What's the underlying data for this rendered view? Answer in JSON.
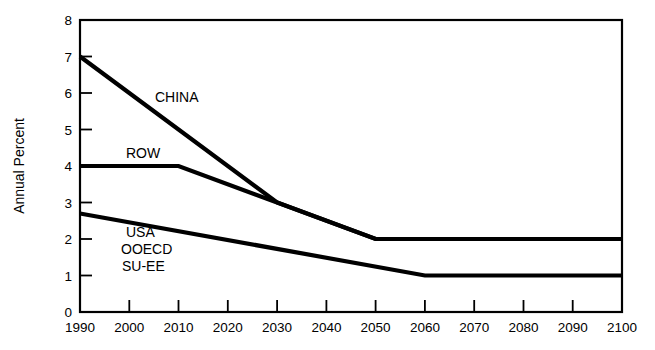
{
  "chart_data": {
    "type": "line",
    "title": "",
    "xlabel": "",
    "ylabel": "Annual Percent",
    "xlim": [
      1990,
      2100
    ],
    "ylim": [
      0,
      8
    ],
    "grid": false,
    "legend": "inline-annotations",
    "x_ticks": [
      "1990",
      "2000",
      "2010",
      "2020",
      "2030",
      "2040",
      "2050",
      "2060",
      "2070",
      "2080",
      "2090",
      "2100"
    ],
    "y_ticks": [
      "0",
      "1",
      "2",
      "3",
      "4",
      "5",
      "6",
      "7",
      "8"
    ],
    "series": [
      {
        "name": "CHINA",
        "label": "CHINA",
        "x": [
          1990,
          2030,
          2050,
          2100
        ],
        "values": [
          7.0,
          3.0,
          2.0,
          2.0
        ]
      },
      {
        "name": "ROW",
        "label": "ROW",
        "x": [
          1990,
          2010,
          2030,
          2050,
          2100
        ],
        "values": [
          4.0,
          4.0,
          3.0,
          2.0,
          2.0
        ]
      },
      {
        "name": "USA-OOECD-SU-EE",
        "label": "USA",
        "x": [
          1990,
          2060,
          2100
        ],
        "values": [
          2.7,
          1.0,
          1.0
        ]
      }
    ],
    "annotations": [
      {
        "text": "CHINA",
        "x": 2020,
        "y": 6.0
      },
      {
        "text": "ROW",
        "x": 2000,
        "y": 4.45
      },
      {
        "text": "USA",
        "x": 2002,
        "y": 2.35
      },
      {
        "text": "OOECD",
        "x": 2002,
        "y": 1.95
      },
      {
        "text": "SU-EE",
        "x": 2002,
        "y": 1.55
      }
    ],
    "colors": {
      "line": "#000000",
      "axis": "#000000",
      "background": "#ffffff",
      "text": "#000000"
    }
  }
}
